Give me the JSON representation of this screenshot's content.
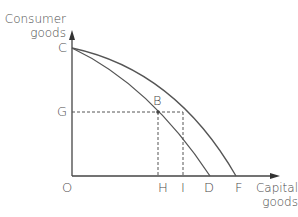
{
  "diagram": {
    "y_axis": {
      "label_line1": "Consumer",
      "label_line2": "goods"
    },
    "x_axis": {
      "label_line1": "Capital",
      "label_line2": "goods"
    },
    "points": {
      "origin": "O",
      "c": "C",
      "g": "G",
      "b": "B",
      "h": "H",
      "i": "I",
      "d": "D",
      "f": "F"
    },
    "curves": [
      {
        "name": "inner-ppf",
        "from": "C",
        "to": "D"
      },
      {
        "name": "outer-ppf",
        "from": "C",
        "to": "F"
      }
    ],
    "colors": {
      "line": "#555555",
      "text": "#4a4a4a"
    }
  }
}
